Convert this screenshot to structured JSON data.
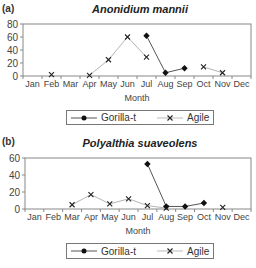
{
  "chart_data": [
    {
      "type": "line",
      "panel_label": "(a)",
      "title": "Anonidium mannii",
      "xlabel": "Month",
      "ylabel": "",
      "ylim": [
        0,
        80
      ],
      "yticks": [
        0,
        20,
        40,
        60,
        80
      ],
      "grid": false,
      "legend_position": "bottom",
      "categories": [
        "Jan",
        "Feb",
        "Mar",
        "Apr",
        "May",
        "Jun",
        "Jul",
        "Aug",
        "Sep",
        "Oct",
        "Nov",
        "Dec"
      ],
      "series": [
        {
          "name": "Gorilla-t",
          "marker": "diamond-filled",
          "color": "#555555",
          "values": [
            null,
            null,
            null,
            null,
            null,
            null,
            62,
            5,
            12,
            null,
            null,
            null
          ]
        },
        {
          "name": "Agile",
          "marker": "x",
          "color": "#aaaaaa",
          "values": [
            null,
            2,
            null,
            1,
            25,
            60,
            29,
            null,
            null,
            14,
            5,
            null
          ]
        }
      ]
    },
    {
      "type": "line",
      "panel_label": "(b)",
      "title": "Polyalthia suaveolens",
      "xlabel": "Month",
      "ylabel": "",
      "ylim": [
        0,
        60
      ],
      "yticks": [
        0,
        20,
        40,
        60
      ],
      "grid": false,
      "legend_position": "bottom",
      "categories": [
        "Jan",
        "Feb",
        "Mar",
        "Apr",
        "May",
        "Jun",
        "Jul",
        "Aug",
        "Sep",
        "Oct",
        "Nov",
        "Dec"
      ],
      "series": [
        {
          "name": "Gorilla-t",
          "marker": "diamond-filled",
          "color": "#555555",
          "values": [
            null,
            null,
            null,
            null,
            null,
            null,
            53,
            3,
            3,
            7,
            null,
            null
          ]
        },
        {
          "name": "Agile",
          "marker": "x",
          "color": "#aaaaaa",
          "values": [
            null,
            null,
            5,
            17,
            6,
            12,
            4,
            1,
            null,
            null,
            2,
            null
          ]
        }
      ]
    }
  ]
}
